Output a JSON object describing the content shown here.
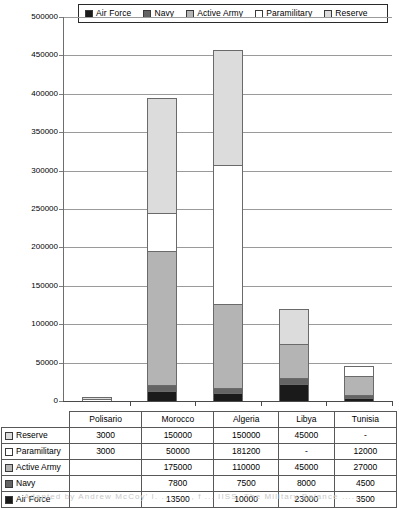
{
  "legend": {
    "items": [
      {
        "label": "Air Force",
        "color": "#1a1a1a",
        "icon": "square-filled-black-icon"
      },
      {
        "label": "Navy",
        "color": "#646464",
        "icon": "square-filled-darkgray-icon"
      },
      {
        "label": "Active Army",
        "color": "#b4b4b4",
        "icon": "square-filled-midgray-icon"
      },
      {
        "label": "Paramilitary",
        "color": "#ffffff",
        "icon": "square-outline-white-icon"
      },
      {
        "label": "Reserve",
        "color": "#dcdcdc",
        "icon": "square-filled-lightgray-icon"
      }
    ]
  },
  "axis": {
    "y_ticks": [
      "500000",
      "450000",
      "400000",
      "350000",
      "300000",
      "250000",
      "200000",
      "150000",
      "100000",
      "50000",
      "0"
    ],
    "y_min": 0,
    "y_max": 500000,
    "y_step": 50000
  },
  "table": {
    "corner": "",
    "columns": [
      "Polisario",
      "Morocco",
      "Algeria",
      "Libya",
      "Tunisia"
    ],
    "rows": [
      {
        "label": "Reserve",
        "color": "#dcdcdc",
        "icon": "square-filled-lightgray-icon",
        "values": [
          "3000",
          "150000",
          "150000",
          "45000",
          "-"
        ]
      },
      {
        "label": "Paramilitary",
        "color": "#ffffff",
        "icon": "square-outline-white-icon",
        "values": [
          "3000",
          "50000",
          "181200",
          "-",
          "12000"
        ]
      },
      {
        "label": "Active Army",
        "color": "#b4b4b4",
        "icon": "square-filled-midgray-icon",
        "values": [
          "",
          "175000",
          "110000",
          "45000",
          "27000"
        ]
      },
      {
        "label": "Navy",
        "color": "#646464",
        "icon": "square-filled-darkgray-icon",
        "values": [
          "",
          "7800",
          "7500",
          "8000",
          "4500"
        ]
      },
      {
        "label": "Air Force",
        "color": "#1a1a1a",
        "icon": "square-filled-black-icon",
        "values": [
          "",
          "13500",
          "10000",
          "23000",
          "3500"
        ]
      }
    ]
  },
  "chart_data": {
    "type": "bar",
    "stacked": true,
    "title": "",
    "xlabel": "",
    "ylabel": "",
    "ylim": [
      0,
      500000
    ],
    "ystep": 50000,
    "grid": true,
    "legend_position": "top",
    "categories": [
      "Polisario",
      "Morocco",
      "Algeria",
      "Libya",
      "Tunisia"
    ],
    "series": [
      {
        "name": "Air Force",
        "color": "#1a1a1a",
        "values": [
          0,
          13500,
          10000,
          23000,
          3500
        ]
      },
      {
        "name": "Navy",
        "color": "#646464",
        "values": [
          0,
          7800,
          7500,
          8000,
          4500
        ]
      },
      {
        "name": "Active Army",
        "color": "#b4b4b4",
        "values": [
          0,
          175000,
          110000,
          45000,
          27000
        ]
      },
      {
        "name": "Paramilitary",
        "color": "#ffffff",
        "values": [
          3000,
          50000,
          181200,
          0,
          12000
        ]
      },
      {
        "name": "Reserve",
        "color": "#dcdcdc",
        "values": [
          3000,
          150000,
          150000,
          45000,
          0
        ]
      }
    ],
    "totals": [
      6000,
      396300,
      458700,
      121000,
      47000
    ]
  },
  "footer": {
    "ghost_text": "Adapted by Andrew McCoy' I. .. ..... , f ... IISS, The Military Balance ..... ,. ."
  }
}
